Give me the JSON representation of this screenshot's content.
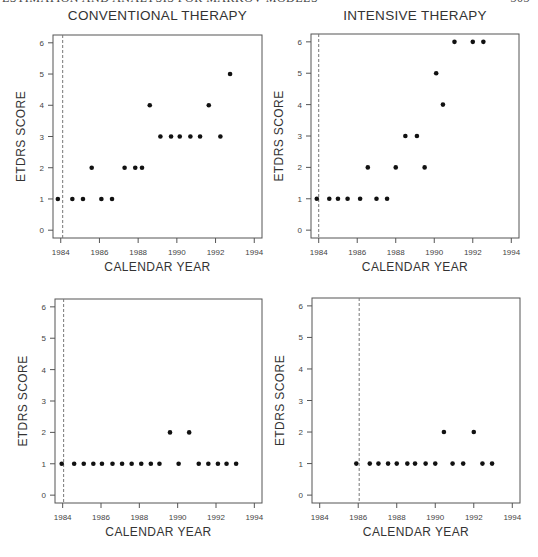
{
  "page_header": {
    "left_text": "ESTIMATION AND ANALYSIS FOR MARKOV MODELS",
    "right_text": "303"
  },
  "caption_partial": "",
  "chart_data": [
    {
      "type": "scatter",
      "id": "top-left",
      "title": "CONVENTIONAL THERAPY",
      "xlabel": "CALENDAR YEAR",
      "ylabel": "ETDRS SCORE",
      "xlim": [
        1983.6,
        1994.4
      ],
      "ylim": [
        -0.25,
        6.25
      ],
      "xticks": [
        1984,
        1986,
        1988,
        1990,
        1992,
        1994
      ],
      "yticks": [
        0,
        1,
        2,
        3,
        4,
        5,
        6
      ],
      "grid": false,
      "reference_line_x": 1984.1,
      "points": [
        {
          "x": 1983.85,
          "y": 1
        },
        {
          "x": 1984.6,
          "y": 1
        },
        {
          "x": 1985.15,
          "y": 1
        },
        {
          "x": 1985.6,
          "y": 2
        },
        {
          "x": 1986.1,
          "y": 1
        },
        {
          "x": 1986.65,
          "y": 1
        },
        {
          "x": 1987.3,
          "y": 2
        },
        {
          "x": 1987.85,
          "y": 2
        },
        {
          "x": 1988.2,
          "y": 2
        },
        {
          "x": 1988.6,
          "y": 4
        },
        {
          "x": 1989.15,
          "y": 3
        },
        {
          "x": 1989.7,
          "y": 3
        },
        {
          "x": 1990.15,
          "y": 3
        },
        {
          "x": 1990.7,
          "y": 3
        },
        {
          "x": 1991.2,
          "y": 3
        },
        {
          "x": 1991.65,
          "y": 4
        },
        {
          "x": 1992.25,
          "y": 3
        },
        {
          "x": 1992.75,
          "y": 5
        }
      ]
    },
    {
      "type": "scatter",
      "id": "top-right",
      "title": "INTENSIVE THERAPY",
      "xlabel": "CALENDAR YEAR",
      "ylabel": "ETDRS SCORE",
      "xlim": [
        1983.6,
        1994.4
      ],
      "ylim": [
        -0.25,
        6.25
      ],
      "xticks": [
        1984,
        1986,
        1988,
        1990,
        1992,
        1994
      ],
      "yticks": [
        0,
        1,
        2,
        3,
        4,
        5,
        6
      ],
      "grid": false,
      "reference_line_x": 1984.0,
      "points": [
        {
          "x": 1983.9,
          "y": 1
        },
        {
          "x": 1984.55,
          "y": 1
        },
        {
          "x": 1985.0,
          "y": 1
        },
        {
          "x": 1985.5,
          "y": 1
        },
        {
          "x": 1986.15,
          "y": 1
        },
        {
          "x": 1986.55,
          "y": 2
        },
        {
          "x": 1987.0,
          "y": 1
        },
        {
          "x": 1987.55,
          "y": 1
        },
        {
          "x": 1988.0,
          "y": 2
        },
        {
          "x": 1988.5,
          "y": 3
        },
        {
          "x": 1989.1,
          "y": 3
        },
        {
          "x": 1989.5,
          "y": 2
        },
        {
          "x": 1990.1,
          "y": 5
        },
        {
          "x": 1990.45,
          "y": 4
        },
        {
          "x": 1991.05,
          "y": 6
        },
        {
          "x": 1992.0,
          "y": 6
        },
        {
          "x": 1992.55,
          "y": 6
        }
      ]
    },
    {
      "type": "scatter",
      "id": "bottom-left",
      "title": "",
      "xlabel": "CALENDAR YEAR",
      "ylabel": "ETDRS SCORE",
      "xlim": [
        1983.6,
        1994.4
      ],
      "ylim": [
        -0.25,
        6.25
      ],
      "xticks": [
        1984,
        1986,
        1988,
        1990,
        1992,
        1994
      ],
      "yticks": [
        0,
        1,
        2,
        3,
        4,
        5,
        6
      ],
      "grid": false,
      "reference_line_x": 1984.05,
      "points": [
        {
          "x": 1983.95,
          "y": 1
        },
        {
          "x": 1984.6,
          "y": 1
        },
        {
          "x": 1985.1,
          "y": 1
        },
        {
          "x": 1985.6,
          "y": 1
        },
        {
          "x": 1986.05,
          "y": 1
        },
        {
          "x": 1986.6,
          "y": 1
        },
        {
          "x": 1987.1,
          "y": 1
        },
        {
          "x": 1987.6,
          "y": 1
        },
        {
          "x": 1988.1,
          "y": 1
        },
        {
          "x": 1988.6,
          "y": 1
        },
        {
          "x": 1989.05,
          "y": 1
        },
        {
          "x": 1989.6,
          "y": 2
        },
        {
          "x": 1990.05,
          "y": 1
        },
        {
          "x": 1990.6,
          "y": 2
        },
        {
          "x": 1991.1,
          "y": 1
        },
        {
          "x": 1991.6,
          "y": 1
        },
        {
          "x": 1992.1,
          "y": 1
        },
        {
          "x": 1992.55,
          "y": 1
        },
        {
          "x": 1993.05,
          "y": 1
        }
      ]
    },
    {
      "type": "scatter",
      "id": "bottom-right",
      "title": "",
      "xlabel": "CALENDAR YEAR",
      "ylabel": "ETDRS SCORE",
      "xlim": [
        1983.6,
        1994.4
      ],
      "ylim": [
        -0.25,
        6.25
      ],
      "xticks": [
        1984,
        1986,
        1988,
        1990,
        1992,
        1994
      ],
      "yticks": [
        0,
        1,
        2,
        3,
        4,
        5,
        6
      ],
      "grid": false,
      "reference_line_x": 1986.05,
      "points": [
        {
          "x": 1985.9,
          "y": 1
        },
        {
          "x": 1986.6,
          "y": 1
        },
        {
          "x": 1987.05,
          "y": 1
        },
        {
          "x": 1987.55,
          "y": 1
        },
        {
          "x": 1988.0,
          "y": 1
        },
        {
          "x": 1988.55,
          "y": 1
        },
        {
          "x": 1988.95,
          "y": 1
        },
        {
          "x": 1989.5,
          "y": 1
        },
        {
          "x": 1990.0,
          "y": 1
        },
        {
          "x": 1990.45,
          "y": 2
        },
        {
          "x": 1990.9,
          "y": 1
        },
        {
          "x": 1991.45,
          "y": 1
        },
        {
          "x": 1992.0,
          "y": 2
        },
        {
          "x": 1992.45,
          "y": 1
        },
        {
          "x": 1992.95,
          "y": 1
        }
      ]
    }
  ],
  "layout": {
    "panels": [
      {
        "left": 53,
        "top": 35,
        "width": 209,
        "height": 203
      },
      {
        "left": 311,
        "top": 34,
        "width": 208,
        "height": 204
      },
      {
        "left": 55,
        "top": 299,
        "width": 207,
        "height": 204
      },
      {
        "left": 312,
        "top": 298,
        "width": 208,
        "height": 205
      }
    ],
    "point_color": "#111111",
    "axis_color": "#555555",
    "dash_color": "#777777"
  }
}
